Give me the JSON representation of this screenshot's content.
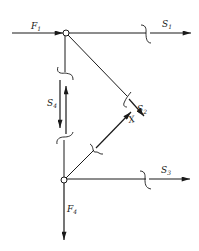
{
  "diagram": {
    "type": "truss-free-body-cut",
    "colors": {
      "ink": "#1a1a1a",
      "background": "#ffffff"
    },
    "nodes": [
      {
        "id": "top",
        "x": 66,
        "y": 33
      },
      {
        "id": "bottom",
        "x": 64,
        "y": 180
      }
    ],
    "labels": {
      "F1": {
        "base": "F",
        "sub": "1"
      },
      "S1": {
        "base": "S",
        "sub": "1"
      },
      "S2": {
        "base": "S",
        "sub": "2"
      },
      "S3": {
        "base": "S",
        "sub": "3"
      },
      "S4": {
        "base": "S",
        "sub": "4"
      },
      "F4": {
        "base": "F",
        "sub": "4"
      },
      "X": {
        "base": "X",
        "sub": ""
      }
    }
  }
}
